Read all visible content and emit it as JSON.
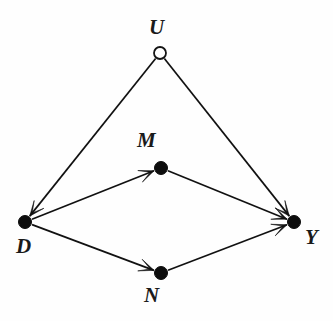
{
  "figure": {
    "type": "causal-dag",
    "background_color": "#fefefe",
    "ink_color": "#111111",
    "width": 333,
    "height": 321
  },
  "nodes": [
    {
      "id": "U",
      "label": "U",
      "style": "hollow",
      "x": 160,
      "y": 53,
      "radius": 6,
      "label_x": 149,
      "label_y": 17
    },
    {
      "id": "M",
      "label": "M",
      "style": "filled",
      "x": 161,
      "y": 168,
      "radius": 6.5,
      "label_x": 137,
      "label_y": 130
    },
    {
      "id": "D",
      "label": "D",
      "style": "filled",
      "x": 25,
      "y": 222,
      "radius": 6.5,
      "label_x": 16,
      "label_y": 236
    },
    {
      "id": "N",
      "label": "N",
      "style": "filled",
      "x": 161,
      "y": 273,
      "radius": 6.5,
      "label_x": 144,
      "label_y": 285
    },
    {
      "id": "Y",
      "label": "Y",
      "style": "filled",
      "x": 294,
      "y": 222,
      "radius": 6.5,
      "label_x": 305,
      "label_y": 227
    }
  ],
  "edges": [
    {
      "id": "U-D",
      "from": "U",
      "to": "D",
      "directed": true,
      "arrow_at": "end"
    },
    {
      "id": "U-Y",
      "from": "U",
      "to": "Y",
      "directed": true,
      "arrow_at": "end"
    },
    {
      "id": "D-M",
      "from": "D",
      "to": "M",
      "directed": true,
      "arrow_at": "end"
    },
    {
      "id": "D-N",
      "from": "D",
      "to": "N",
      "directed": true,
      "arrow_at": "end"
    },
    {
      "id": "M-Y",
      "from": "M",
      "to": "Y",
      "directed": true,
      "arrow_at": "end"
    },
    {
      "id": "N-Y",
      "from": "N",
      "to": "Y",
      "directed": true,
      "arrow_at": "end"
    }
  ]
}
